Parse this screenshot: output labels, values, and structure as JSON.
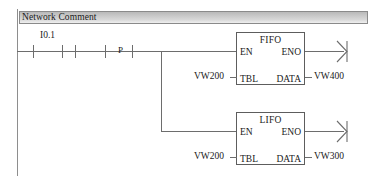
{
  "diagram": {
    "type": "plc-ladder-logic",
    "network": {
      "comment": "Network Comment"
    },
    "rung": {
      "contacts": [
        {
          "id": "contact-1",
          "label": "I0.1",
          "kind": "normally-open"
        },
        {
          "id": "contact-2",
          "label": "",
          "kind": "normally-open"
        },
        {
          "id": "contact-3",
          "label": "P",
          "kind": "positive-transition"
        }
      ]
    },
    "blocks": [
      {
        "id": "fifo",
        "title": "FIFO",
        "pins": {
          "en": "EN",
          "eno": "ENO",
          "tbl": "TBL",
          "data": "DATA"
        },
        "inputs": {
          "tbl": "VW200"
        },
        "outputs": {
          "data": "VW400"
        }
      },
      {
        "id": "lifo",
        "title": "LIFO",
        "pins": {
          "en": "EN",
          "eno": "ENO",
          "tbl": "TBL",
          "data": "DATA"
        },
        "inputs": {
          "tbl": "VW200"
        },
        "outputs": {
          "data": "VW300"
        }
      }
    ],
    "colors": {
      "wire": "#6d6d6d",
      "rail": "#8e8e8e",
      "box_border": "#5d5d5d",
      "text": "#1a1a1a",
      "header_bar_border": "#8a8a8a",
      "background": "#ffffff"
    }
  }
}
